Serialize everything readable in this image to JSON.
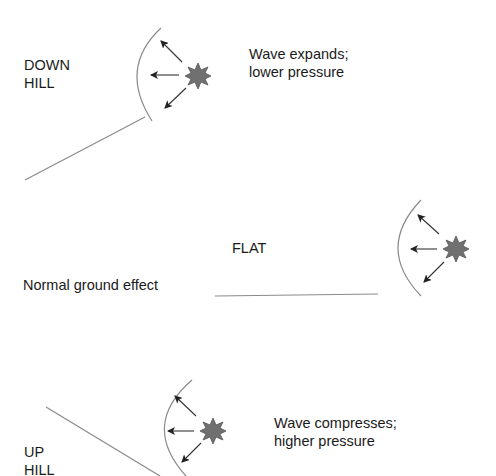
{
  "scenarios": [
    {
      "id": "downhill",
      "terrain_label_line1": "DOWN",
      "terrain_label_line2": "HILL",
      "note_line1": "Wave expands;",
      "note_line2": "lower pressure"
    },
    {
      "id": "flat",
      "terrain_label": "FLAT",
      "note": "Normal ground effect"
    },
    {
      "id": "uphill",
      "terrain_label_line1": "UP",
      "terrain_label_line2": "HILL",
      "note_line1": "Wave compresses;",
      "note_line2": "higher pressure"
    }
  ],
  "colors": {
    "line": "#8a8a8a",
    "arrow": "#333333",
    "burst": "#6e6e6e",
    "text": "#1a1a1a"
  },
  "icons": {
    "source": "starburst-explosion",
    "wavefront": "arc",
    "direction": "arrow"
  }
}
